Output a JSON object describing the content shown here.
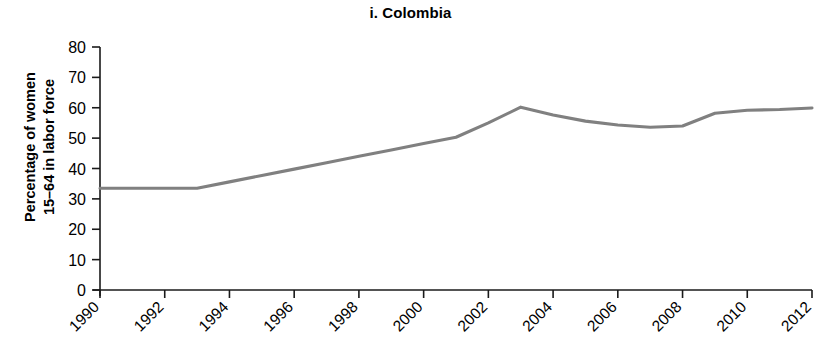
{
  "chart_data": {
    "type": "line",
    "title": "i. Colombia",
    "xlabel": "",
    "ylabel": "Percentage of women\n15–64 in labor force",
    "xlim": [
      1990,
      2012
    ],
    "ylim": [
      0,
      80
    ],
    "grid": false,
    "legend": null,
    "y_ticks": [
      80,
      70,
      60,
      50,
      40,
      30,
      20,
      10,
      0
    ],
    "x_ticks": [
      1990,
      1992,
      1994,
      1996,
      1998,
      2000,
      2002,
      2004,
      2006,
      2008,
      2010,
      2012
    ],
    "x_tick_rotation": 45,
    "line_color": "#808080",
    "series": [
      {
        "name": "Colombia",
        "x": [
          1990,
          1991,
          1992,
          1993,
          1994,
          1995,
          1996,
          1997,
          1998,
          1999,
          2000,
          2001,
          2002,
          2003,
          2004,
          2005,
          2006,
          2007,
          2008,
          2009,
          2010,
          2011,
          2012
        ],
        "values": [
          33.5,
          33.5,
          33.5,
          33.5,
          35.6,
          37.7,
          39.8,
          41.9,
          44.0,
          46.1,
          48.2,
          50.3,
          55.0,
          60.2,
          57.6,
          55.6,
          54.3,
          53.6,
          54.0,
          58.2,
          59.2,
          59.4,
          59.9
        ]
      }
    ]
  }
}
